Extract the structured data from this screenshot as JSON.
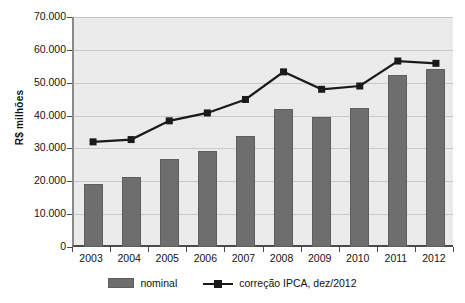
{
  "chart_data": {
    "type": "bar",
    "title": "",
    "subtitle": "",
    "xlabel": "",
    "ylabel": "R$ milhões",
    "ylim": [
      0,
      70000
    ],
    "ytick_step": 10000,
    "grid": true,
    "legend_position": "bottom",
    "categories": [
      "2003",
      "2004",
      "2005",
      "2006",
      "2007",
      "2008",
      "2009",
      "2010",
      "2011",
      "2012"
    ],
    "ytick_labels": [
      "0",
      "10.000",
      "20.000",
      "30.000",
      "40.000",
      "50.000",
      "60.000",
      "70.000"
    ],
    "ytick_values": [
      0,
      10000,
      20000,
      30000,
      40000,
      50000,
      60000,
      70000
    ],
    "series": [
      {
        "name": "nominal",
        "render": "bar",
        "color": "#6e6e6e",
        "values": [
          19200,
          21200,
          26800,
          29300,
          33700,
          41900,
          39500,
          42300,
          52500,
          54200
        ]
      },
      {
        "name": "correção IPCA, dez/2012",
        "render": "line",
        "color": "#1a1a1a",
        "marker": "square",
        "values": [
          32000,
          32700,
          38400,
          40800,
          44900,
          53300,
          48000,
          49000,
          56600,
          55900
        ]
      }
    ]
  },
  "legend": {
    "items": [
      {
        "label": "nominal",
        "marker": "bar-swatch"
      },
      {
        "label": "correção IPCA, dez/2012",
        "marker": "line-square-marker"
      }
    ]
  },
  "axes": {
    "y_title": "R$ milhões"
  }
}
